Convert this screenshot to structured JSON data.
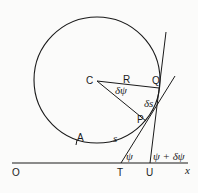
{
  "diagram": {
    "colors": {
      "stroke": "#1a1a1a",
      "background": "#fbfbfa"
    },
    "points": {
      "C": "C",
      "Q": "Q",
      "P": "P",
      "A": "A",
      "O": "O",
      "T": "T",
      "U": "U"
    },
    "labels": {
      "radius": "R",
      "delta_psi": "δψ",
      "delta_s": "δs",
      "arc": "s",
      "psi": "ψ",
      "psi_plus": "ψ + δψ",
      "x_axis": "x"
    }
  }
}
